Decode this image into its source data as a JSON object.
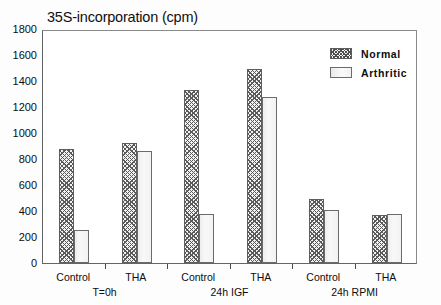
{
  "chart_data": {
    "type": "bar",
    "title": "35S-incorporation (cpm)",
    "xlabel": "",
    "ylabel": "",
    "ylim": [
      0,
      1800
    ],
    "ytick_step": 200,
    "yticks": [
      1800,
      1600,
      1400,
      1200,
      1000,
      800,
      600,
      400,
      200,
      0
    ],
    "grid": false,
    "legend_position": "top-right",
    "categories": [
      "Control",
      "THA",
      "Control",
      "THA",
      "Control",
      "THA"
    ],
    "groups": [
      {
        "label": "T=0h",
        "categories": [
          "Control",
          "THA"
        ]
      },
      {
        "label": "24h IGF",
        "categories": [
          "Control",
          "THA"
        ]
      },
      {
        "label": "24h RPMI",
        "categories": [
          "Control",
          "THA"
        ]
      }
    ],
    "series": [
      {
        "name": "Normal",
        "values": [
          880,
          920,
          1330,
          1490,
          490,
          370
        ]
      },
      {
        "name": "Arthritic",
        "values": [
          255,
          860,
          380,
          1275,
          405,
          380
        ]
      }
    ]
  },
  "legend": {
    "items": [
      {
        "label": "Normal"
      },
      {
        "label": "Arthritic"
      }
    ]
  }
}
